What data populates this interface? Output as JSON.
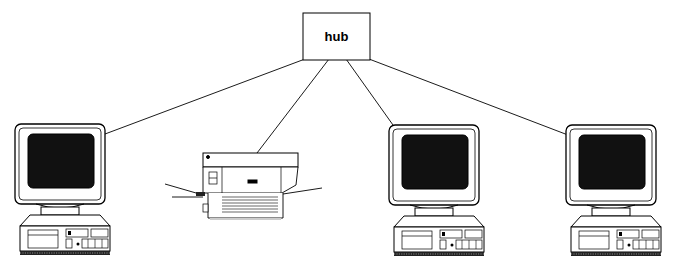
{
  "diagram": {
    "type": "network-topology",
    "hub": {
      "label": "hub"
    },
    "nodes": [
      {
        "id": "computer-1",
        "kind": "computer"
      },
      {
        "id": "printer",
        "kind": "printer"
      },
      {
        "id": "computer-2",
        "kind": "computer"
      },
      {
        "id": "computer-3",
        "kind": "computer"
      }
    ],
    "connections": [
      {
        "from": "hub",
        "to": "computer-1"
      },
      {
        "from": "hub",
        "to": "printer"
      },
      {
        "from": "hub",
        "to": "computer-2"
      },
      {
        "from": "hub",
        "to": "computer-3"
      }
    ]
  }
}
